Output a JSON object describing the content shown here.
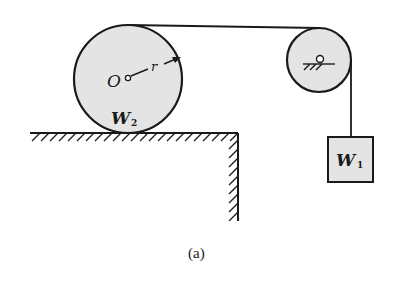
{
  "figure": {
    "caption": "(a)",
    "colors": {
      "stroke": "#1a1a1a",
      "fill_shaded": "#e4e4e4",
      "background": "#ffffff"
    }
  },
  "disk": {
    "center_label": "O",
    "radius_label": "r",
    "weight_label": "W",
    "weight_subscript": "2"
  },
  "pulley": {
    "support_symbol": "pin-support"
  },
  "block": {
    "weight_label": "W",
    "weight_subscript": "1"
  },
  "ground": {
    "type": "hatched-ledge"
  }
}
